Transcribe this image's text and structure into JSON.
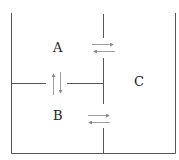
{
  "diagram": {
    "type": "compartment-diagram",
    "compartments": [
      {
        "id": "A",
        "label": "A"
      },
      {
        "id": "B",
        "label": "B"
      },
      {
        "id": "C",
        "label": "C"
      }
    ],
    "exchanges": [
      {
        "between": [
          "A",
          "C"
        ],
        "arrows": "bidirectional-horizontal"
      },
      {
        "between": [
          "A",
          "B"
        ],
        "arrows": "bidirectional-vertical"
      },
      {
        "between": [
          "B",
          "C"
        ],
        "arrows": "bidirectional-horizontal"
      }
    ],
    "colors": {
      "line": "#555555",
      "arrow": "#888888"
    }
  }
}
